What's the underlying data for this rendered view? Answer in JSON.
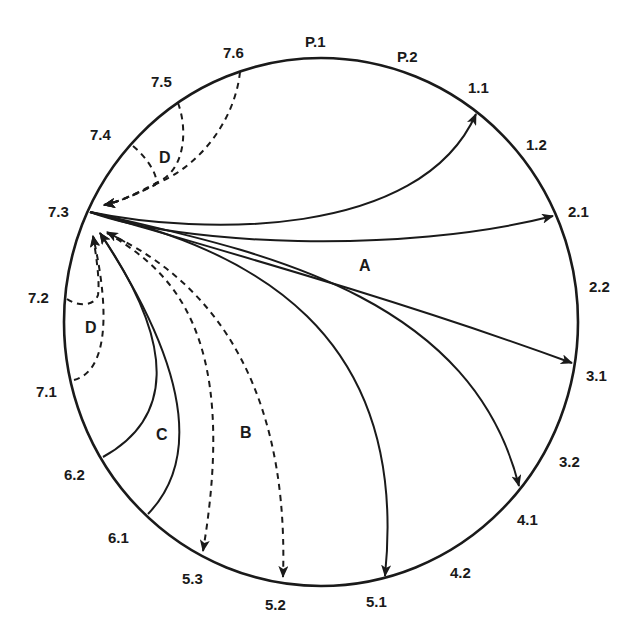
{
  "diagram": {
    "circle": {
      "cx": 321,
      "cy": 322,
      "rx": 257,
      "ry": 264,
      "color": "#1a1a1a"
    },
    "source_point": "7.3",
    "point_labels": [
      {
        "id": "P.1",
        "text": "P.1"
      },
      {
        "id": "P.2",
        "text": "P.2"
      },
      {
        "id": "1.1",
        "text": "1.1"
      },
      {
        "id": "1.2",
        "text": "1.2"
      },
      {
        "id": "2.1",
        "text": "2.1"
      },
      {
        "id": "2.2",
        "text": "2.2"
      },
      {
        "id": "3.1",
        "text": "3.1"
      },
      {
        "id": "3.2",
        "text": "3.2"
      },
      {
        "id": "4.1",
        "text": "4.1"
      },
      {
        "id": "4.2",
        "text": "4.2"
      },
      {
        "id": "5.1",
        "text": "5.1"
      },
      {
        "id": "5.2",
        "text": "5.2"
      },
      {
        "id": "5.3",
        "text": "5.3"
      },
      {
        "id": "6.1",
        "text": "6.1"
      },
      {
        "id": "6.2",
        "text": "6.2"
      },
      {
        "id": "7.1",
        "text": "7.1"
      },
      {
        "id": "7.2",
        "text": "7.2"
      },
      {
        "id": "7.3",
        "text": "7.3"
      },
      {
        "id": "7.4",
        "text": "7.4"
      },
      {
        "id": "7.5",
        "text": "7.5"
      },
      {
        "id": "7.6",
        "text": "7.6"
      }
    ],
    "regions": [
      {
        "id": "A",
        "text": "A",
        "style": "solid",
        "description": "Outgoing arrows from 7.3 to 1.1, 2.1, 3.1, 4.1, 5.1"
      },
      {
        "id": "B",
        "text": "B",
        "style": "dashed",
        "description": "Bidirectional dashed arrows between 7.3 and 5.3, 5.2"
      },
      {
        "id": "C",
        "text": "C",
        "style": "solid",
        "description": "Incoming solid arrows from 6.2 and 6.1 to 7.3"
      },
      {
        "id": "D_upper",
        "text": "D",
        "style": "dashed",
        "description": "Incoming dashed arrows from 7.4, 7.5, 7.6 to 7.3"
      },
      {
        "id": "D_lower",
        "text": "D",
        "style": "dashed",
        "description": "Incoming dashed arrows from 7.2, 7.1 to 7.3"
      }
    ],
    "edges": [
      {
        "from": "7.3",
        "to": "1.1",
        "style": "solid",
        "group": "A"
      },
      {
        "from": "7.3",
        "to": "2.1",
        "style": "solid",
        "group": "A"
      },
      {
        "from": "7.3",
        "to": "3.1",
        "style": "solid",
        "group": "A"
      },
      {
        "from": "7.3",
        "to": "4.1",
        "style": "solid",
        "group": "A"
      },
      {
        "from": "7.3",
        "to": "5.1",
        "style": "solid",
        "group": "A"
      },
      {
        "from": "7.3",
        "to": "5.3",
        "style": "dashed",
        "group": "B",
        "bidirectional": true
      },
      {
        "from": "7.3",
        "to": "5.2",
        "style": "dashed",
        "group": "B",
        "bidirectional": true
      },
      {
        "from": "6.2",
        "to": "7.3",
        "style": "solid",
        "group": "C"
      },
      {
        "from": "6.1",
        "to": "7.3",
        "style": "solid",
        "group": "C"
      },
      {
        "from": "7.4",
        "to": "7.3",
        "style": "dashed",
        "group": "D"
      },
      {
        "from": "7.5",
        "to": "7.3",
        "style": "dashed",
        "group": "D"
      },
      {
        "from": "7.6",
        "to": "7.3",
        "style": "dashed",
        "group": "D"
      },
      {
        "from": "7.2",
        "to": "7.3",
        "style": "dashed",
        "group": "D"
      },
      {
        "from": "7.1",
        "to": "7.3",
        "style": "dashed",
        "group": "D"
      }
    ]
  }
}
